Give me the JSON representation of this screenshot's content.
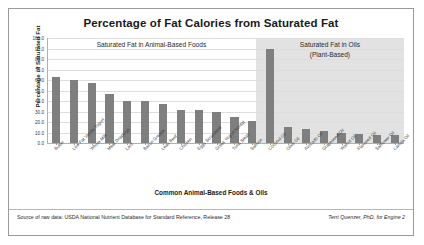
{
  "chart_data": {
    "type": "bar",
    "title": "Percentage of Fat Calories from Saturated Fat",
    "xlabel": "Common Animal-Based Foods & Oils",
    "ylabel": "Percentage of Saturated Fat",
    "ylim": [
      0,
      100
    ],
    "ytick_step": 10,
    "ytick_labels": [
      "100.0",
      "90.0",
      "80.0",
      "70.0",
      "60.0",
      "50.0",
      "40.0",
      "30.0",
      "20.0",
      "10.0",
      "0.0"
    ],
    "grid": true,
    "legend": "none",
    "bar_color": "#7f7f7f",
    "categories": [
      "Butter",
      "Low Fat Vanilla Yogurt",
      "Whole Milk",
      "Meat Drippings",
      "Lard",
      "Bacon Grease",
      "Lean Beef",
      "Chicken",
      "Eggs Scrambled",
      "Greek Yogurt Nonfat",
      "Tuna Steak",
      "Salmon",
      "Coconut Oil",
      "Olive Oil",
      "Avocado Oil",
      "Grapeseed Oil",
      "Walnut Oil",
      "Flaxseed Oil",
      "Safflower Oil",
      "Canola Oil"
    ],
    "values": [
      63,
      60,
      57,
      47,
      40,
      40,
      37,
      31,
      31,
      30,
      25,
      21,
      90,
      15,
      13,
      11,
      10,
      9,
      8,
      8
    ],
    "annotations": [
      {
        "text": "Saturated Fat in Animal-Based Foods",
        "region": "animal"
      },
      {
        "text": "Saturated Fat in Oils",
        "region": "oils"
      },
      {
        "text": "(Plant-Based)",
        "region": "oils"
      }
    ],
    "shaded_region": {
      "label": "Saturated Fat in Oils (Plant-Based)",
      "start_category": "Coconut Oil",
      "color": "#e2e2e2"
    }
  },
  "annotations": {
    "animal_band": "Saturated Fat in Animal-Based Foods",
    "oils_band_line1": "Saturated Fat in Oils",
    "oils_band_line2": "(Plant-Based)"
  },
  "footer": {
    "source": "Source of raw data: USDA National Nutrient Database for Standard Reference, Release 28",
    "credit_prefix": "Terri Quenzer, PhD, for ",
    "credit_brand": "Engine 2"
  }
}
